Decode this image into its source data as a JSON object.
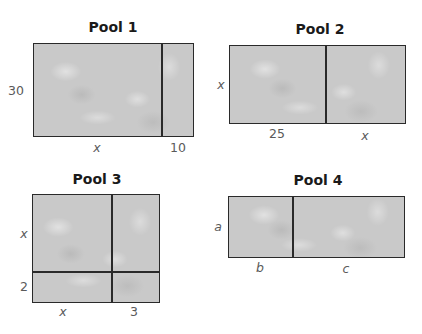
{
  "pools": [
    {
      "title": "Pool 1",
      "labels": {
        "height": "30",
        "width_left": "x",
        "width_right": "10"
      }
    },
    {
      "title": "Pool 2",
      "labels": {
        "height": "x",
        "width_left": "25",
        "width_right": "x"
      }
    },
    {
      "title": "Pool 3",
      "labels": {
        "height_top": "x",
        "height_bottom": "2",
        "width_left": "x",
        "width_right": "3"
      }
    },
    {
      "title": "Pool 4",
      "labels": {
        "height": "a",
        "width_left": "b",
        "width_right": "c"
      }
    }
  ],
  "colors": {
    "pool_fill": "#c9c9c9",
    "border": "#2a2a2a",
    "label": "#5a5a5a",
    "title": "#1a1a1a"
  }
}
